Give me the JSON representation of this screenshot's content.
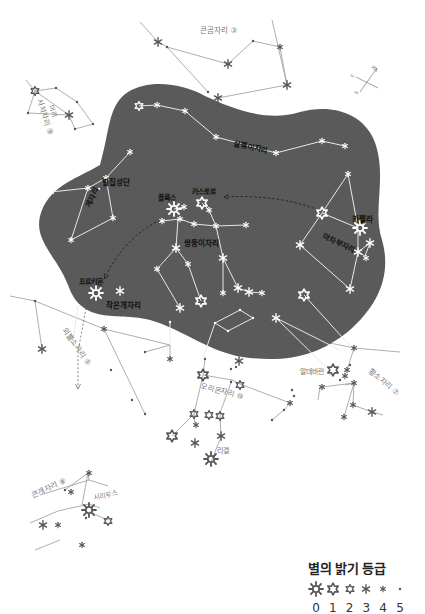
{
  "colors": {
    "region_fill": "#5a5a5a",
    "region_line": "#ffffff",
    "outer_line": "#9a9a9a",
    "outer_star": "#555555",
    "inner_star": "#ffffff",
    "inner_label": "#111111",
    "outer_label": "#666666",
    "arrow": "#222222"
  },
  "labels": {
    "ursa_major": "큰곰자리 ③",
    "leo_minor_lynx": "살쾡이자리",
    "cancer": "게자리",
    "beehive": "벌집성단",
    "gemini": "쌍둥이자리",
    "pollux": "폴룩스",
    "castor": "카스토르",
    "capella": "카펠라",
    "auriga": "마차부자리",
    "procyon": "프로키온",
    "canis_minor": "작은개자리",
    "leo": "사자자리 ⑨",
    "regulus_head": "머리",
    "monoceros": "외뿔소자리 ⑤",
    "aldebaran": "알데바란",
    "taurus": "황소자리 ⑦",
    "orion": "오리온자리 ⑩",
    "rigel": "리겔",
    "canis_major": "큰개자리 ⑧",
    "sirius": "시리우스"
  },
  "legend": {
    "title": "별의 밝기 등급",
    "magnitudes": [
      "0",
      "1",
      "2",
      "3",
      "4",
      "5"
    ]
  },
  "compass": {
    "n": "N",
    "e": "E",
    "s": "S"
  }
}
